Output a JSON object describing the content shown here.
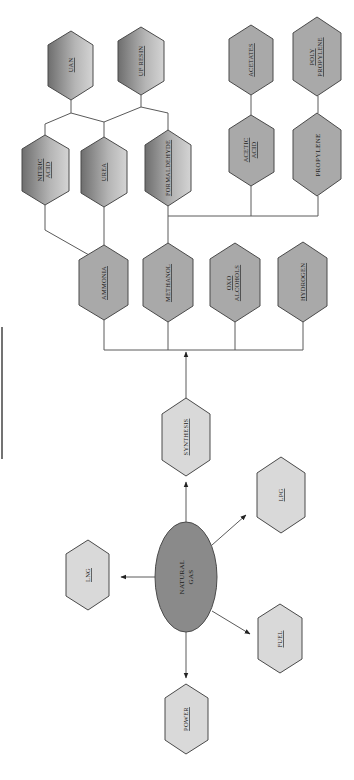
{
  "diagram": {
    "orientation": "rotated-90-ccw",
    "colors": {
      "dark_fill_start": "#6e6e6e",
      "dark_fill_end": "#d0d0d0",
      "mid_fill": "#a8a8a8",
      "light_fill": "#d9d9d9",
      "ellipse_fill": "#8a8a8a",
      "stroke": "#4a4a4a"
    },
    "source": {
      "id": "natural-gas",
      "label_lines": [
        "NATURAL",
        "GAS"
      ]
    },
    "direct_uses": [
      {
        "id": "lng",
        "label_lines": [
          "LNG"
        ]
      },
      {
        "id": "lpg",
        "label_lines": [
          "LPG"
        ]
      },
      {
        "id": "fuel",
        "label_lines": [
          "FUEL"
        ]
      },
      {
        "id": "power",
        "label_lines": [
          "POWER"
        ]
      },
      {
        "id": "synthesis",
        "label_lines": [
          "SYNTHESIS"
        ]
      }
    ],
    "primary_products": [
      {
        "id": "ammonia",
        "label_lines": [
          "AMMONIA"
        ]
      },
      {
        "id": "methanol",
        "label_lines": [
          "METHANOL"
        ]
      },
      {
        "id": "oxo-alcohols",
        "label_lines": [
          "OXO",
          "ALCOHOLS"
        ]
      },
      {
        "id": "hydrogen",
        "label_lines": [
          "HYDROGEN"
        ]
      }
    ],
    "secondary_products": [
      {
        "id": "nitric-acid",
        "label_lines": [
          "NITRIC",
          "ACID"
        ]
      },
      {
        "id": "urea",
        "label_lines": [
          "UREA"
        ]
      },
      {
        "id": "formaldehyde",
        "label_lines": [
          "FORMALDEHYDE"
        ]
      },
      {
        "id": "acetic-acid",
        "label_lines": [
          "ACETIC",
          "ACID"
        ]
      },
      {
        "id": "propylene",
        "label_lines": [
          "PROPYLENE"
        ]
      }
    ],
    "end_products": [
      {
        "id": "uan",
        "label_lines": [
          "UAN"
        ]
      },
      {
        "id": "uf-resin",
        "label_lines": [
          "UF RESIN"
        ]
      },
      {
        "id": "acetates",
        "label_lines": [
          "ACETATES"
        ]
      },
      {
        "id": "polypropylene",
        "label_lines": [
          "POLY",
          "PROPYLENE"
        ]
      }
    ],
    "edges": [
      [
        "natural-gas",
        "lng"
      ],
      [
        "natural-gas",
        "lpg"
      ],
      [
        "natural-gas",
        "fuel"
      ],
      [
        "natural-gas",
        "power"
      ],
      [
        "natural-gas",
        "synthesis"
      ],
      [
        "synthesis",
        "ammonia"
      ],
      [
        "synthesis",
        "methanol"
      ],
      [
        "synthesis",
        "oxo-alcohols"
      ],
      [
        "synthesis",
        "hydrogen"
      ],
      [
        "ammonia",
        "nitric-acid"
      ],
      [
        "ammonia",
        "urea"
      ],
      [
        "methanol",
        "formaldehyde"
      ],
      [
        "methanol",
        "acetic-acid"
      ],
      [
        "methanol",
        "propylene"
      ],
      [
        "nitric-acid",
        "uan"
      ],
      [
        "urea",
        "uan"
      ],
      [
        "urea",
        "uf-resin"
      ],
      [
        "formaldehyde",
        "uf-resin"
      ],
      [
        "acetic-acid",
        "acetates"
      ],
      [
        "propylene",
        "polypropylene"
      ]
    ]
  }
}
